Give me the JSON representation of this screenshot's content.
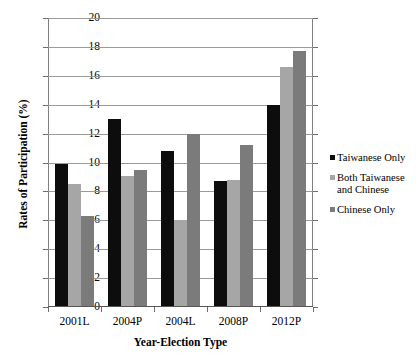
{
  "chart_data": {
    "type": "bar",
    "title": "",
    "xlabel": "Year-Election Type",
    "ylabel": "Rates of Participation (%)",
    "categories": [
      "2001L",
      "2004P",
      "2004L",
      "2008P",
      "2012P"
    ],
    "series": [
      {
        "name": "Taiwanese Only",
        "color": "#0d0d0d",
        "values": [
          9.9,
          13.0,
          10.8,
          8.7,
          14.0
        ]
      },
      {
        "name": "Both Taiwanese and Chinese",
        "color": "#a6a6a6",
        "values": [
          8.5,
          9.1,
          6.0,
          8.8,
          16.6
        ]
      },
      {
        "name": "Chinese Only",
        "color": "#7b7b7b",
        "values": [
          6.3,
          9.5,
          12.0,
          11.2,
          17.7
        ]
      }
    ],
    "ylim": [
      0,
      20
    ],
    "yticks": [
      0,
      2,
      4,
      6,
      8,
      10,
      12,
      14,
      16,
      18,
      20
    ],
    "ytick_labels": [
      "0",
      "2",
      "4",
      "6",
      "8",
      "10",
      "12",
      "14",
      "16",
      "18",
      "20"
    ],
    "grid": true,
    "legend_position": "right"
  },
  "legend": {
    "entries": [
      {
        "label": "Taiwanese Only",
        "color": "#0d0d0d"
      },
      {
        "label": "Both Taiwanese\nand Chinese",
        "color": "#a6a6a6"
      },
      {
        "label": "Chinese Only",
        "color": "#7b7b7b"
      }
    ]
  }
}
